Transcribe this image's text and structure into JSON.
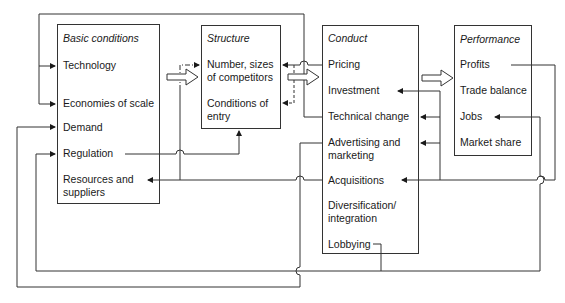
{
  "diagram": {
    "boxes": {
      "basic": {
        "heading": "Basic conditions",
        "items": [
          "Technology",
          "Economies of scale",
          "Demand",
          "Regulation",
          "Resources and",
          "suppliers"
        ]
      },
      "structure": {
        "heading": "Structure",
        "items": [
          "Number, sizes",
          "of competitors",
          "Conditions of",
          "entry"
        ]
      },
      "conduct": {
        "heading": "Conduct",
        "items": [
          "Pricing",
          "Investment",
          "Technical change",
          "Advertising and",
          "marketing",
          "Acquisitions",
          "Diversification/",
          "integration",
          "Lobbying"
        ]
      },
      "performance": {
        "heading": "Performance",
        "items": [
          "Profits",
          "Trade balance",
          "Jobs",
          "Market share"
        ]
      }
    },
    "flows": [
      {
        "from": "Basic conditions",
        "to": "Structure",
        "style": "hollow-arrow"
      },
      {
        "from": "Structure",
        "to": "Conduct",
        "style": "hollow-arrow"
      },
      {
        "from": "Conduct",
        "to": "Performance",
        "style": "hollow-arrow"
      },
      {
        "from": "Technical change",
        "to": "Technology / Economies of scale",
        "style": "feedback"
      },
      {
        "from": "Pricing",
        "to": "Number, sizes of competitors / Conditions of entry",
        "style": "feedback"
      },
      {
        "from": "Regulation",
        "to": "Structure",
        "style": "line"
      },
      {
        "from": "Acquisitions",
        "to": "Resources and suppliers",
        "style": "feedback"
      },
      {
        "from": "Profits",
        "to": "Investment / Technical change / Advertising / Acquisitions",
        "style": "feedback"
      },
      {
        "from": "Advertising and marketing",
        "to": "Demand",
        "style": "feedback"
      },
      {
        "from": "Lobbying",
        "to": "Regulation / Jobs",
        "style": "feedback"
      }
    ]
  }
}
